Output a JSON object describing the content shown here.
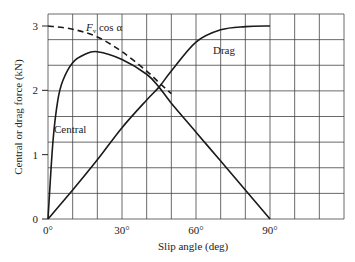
{
  "chart_data": {
    "type": "line",
    "title": "",
    "xlabel": "Slip angle (deg)",
    "ylabel": "Central or drag force (kN)",
    "xlim": [
      0,
      97.5
    ],
    "ylim": [
      0,
      3.19
    ],
    "x_ticks": [
      "0°",
      "30°",
      "60°",
      "90°"
    ],
    "x_tick_values": [
      0,
      30,
      60,
      90
    ],
    "y_ticks": [
      "0",
      "1",
      "2",
      "3"
    ],
    "y_tick_values": [
      0,
      1,
      2,
      3
    ],
    "grid": true,
    "series": [
      {
        "name": "Central",
        "style": "solid",
        "x": [
          0,
          2,
          4,
          6,
          10,
          15,
          20,
          30,
          40,
          45,
          50,
          60,
          70,
          80,
          90
        ],
        "y": [
          0,
          1.2,
          1.85,
          2.15,
          2.43,
          2.56,
          2.6,
          2.48,
          2.25,
          2.05,
          1.8,
          1.35,
          0.9,
          0.45,
          0
        ]
      },
      {
        "name": "Drag",
        "style": "solid",
        "x": [
          0,
          10,
          20,
          30,
          40,
          45,
          50,
          60,
          70,
          80,
          90
        ],
        "y": [
          0,
          0.45,
          0.92,
          1.42,
          1.85,
          2.05,
          2.3,
          2.75,
          2.94,
          2.99,
          3.0
        ]
      },
      {
        "name": "F_v cos α",
        "style": "dashed",
        "x": [
          0,
          10,
          20,
          30,
          40,
          45,
          50
        ],
        "y": [
          3.0,
          2.95,
          2.83,
          2.6,
          2.3,
          2.12,
          1.95
        ]
      }
    ],
    "annotations": [
      {
        "text": "Central",
        "x": 5,
        "y": 1.4
      },
      {
        "text": "Drag",
        "x": 69,
        "y": 2.55
      },
      {
        "text": "F_v cos α",
        "x": 20,
        "y": 3.0
      }
    ]
  },
  "labels": {
    "xlabel": "Slip angle (deg)",
    "ylabel": "Central or drag force (kN)",
    "fv_main": "F",
    "fv_sub": "v",
    "fv_rest": " cos α",
    "central": "Central",
    "drag": "Drag"
  }
}
